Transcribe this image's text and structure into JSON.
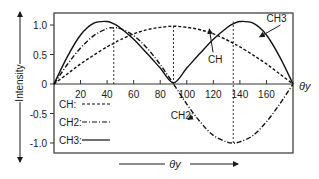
{
  "chart_data": {
    "type": "line",
    "title": "",
    "xlabel": "θy",
    "ylabel": "Intensity",
    "xlim": [
      0,
      180
    ],
    "ylim": [
      -1.05,
      1.15
    ],
    "grid": false,
    "x_ticks": [
      20,
      40,
      60,
      80,
      100,
      120,
      140,
      160
    ],
    "x_tick_labels": [
      "20",
      "40",
      "60",
      "80",
      "100",
      "120",
      "140",
      "160"
    ],
    "y_ticks": [
      1.0,
      0.5,
      0,
      -0.5,
      -1.0
    ],
    "y_tick_labels": [
      "1.0",
      "0.5",
      "0",
      "-0.5",
      "-1.0"
    ],
    "x_axis_end_label": "θy",
    "bottom_arrow_label": "θy",
    "legend": {
      "position": "lower-left-inside",
      "entries": [
        {
          "label": "CH:",
          "style": "dashed"
        },
        {
          "label": "CH2:",
          "style": "dash-dot"
        },
        {
          "label": "CH3:",
          "style": "solid"
        }
      ]
    },
    "annotations": [
      {
        "text": "CH3",
        "x": 160,
        "y": 1.05,
        "arrow_to": [
          155,
          0.8
        ]
      },
      {
        "text": "CH",
        "x": 116,
        "y": 0.35,
        "arrow_to": [
          117,
          0.93
        ]
      },
      {
        "text": "CH2:",
        "x": 88,
        "y": -0.6,
        "arrow_to": [
          101,
          -0.6
        ]
      }
    ],
    "reference_lines": [
      {
        "type": "vertical",
        "x": 45,
        "y_to": 0.95,
        "style": "dotted"
      },
      {
        "type": "vertical",
        "x": 90,
        "y_to": 0.98,
        "style": "dotted"
      },
      {
        "type": "vertical",
        "x": 135,
        "y_from": -1.0,
        "y_to": 1.06,
        "style": "dotted"
      }
    ],
    "x": [
      0,
      10,
      20,
      30,
      40,
      45,
      50,
      60,
      70,
      80,
      90,
      100,
      110,
      120,
      130,
      135,
      140,
      150,
      160,
      170,
      180
    ],
    "series": [
      {
        "name": "CH",
        "style": "dashed",
        "values": [
          0,
          0.17,
          0.34,
          0.49,
          0.63,
          0.69,
          0.75,
          0.85,
          0.92,
          0.96,
          0.98,
          0.96,
          0.92,
          0.85,
          0.75,
          0.69,
          0.63,
          0.49,
          0.34,
          0.17,
          0
        ]
      },
      {
        "name": "CH2",
        "style": "dash-dot",
        "values": [
          0,
          0.33,
          0.61,
          0.82,
          0.94,
          0.95,
          0.94,
          0.82,
          0.61,
          0.33,
          0,
          -0.34,
          -0.64,
          -0.87,
          -0.98,
          -1.0,
          -0.98,
          -0.87,
          -0.64,
          -0.34,
          0
        ]
      },
      {
        "name": "CH3",
        "style": "solid",
        "values": [
          0,
          0.46,
          0.83,
          1.03,
          1.06,
          1.02,
          0.95,
          0.76,
          0.52,
          0.27,
          0.02,
          0.27,
          0.52,
          0.76,
          0.95,
          1.02,
          1.06,
          1.03,
          0.83,
          0.46,
          0
        ]
      }
    ]
  }
}
